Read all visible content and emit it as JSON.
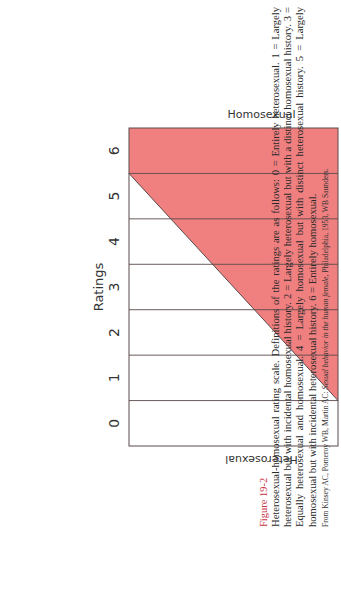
{
  "figure": {
    "label": "Figure 19-2",
    "caption": "Heterosexual-homosexual rating scale. Definitions of the ratings are as follows: 0 = Entirely heterosexual. 1 = Largely heterosexual but with incidental homosexual history. 2 = Largely heterosexual but with a distinct homosexual history. 3 = Equally heterosexual and homosexual. 4 = Largely homosexual but with distinct heterosexual history. 5 = Largely homosexual but with incidental heterosexual history. 6 = Entirely homosexual.",
    "source_prefix": "From Kinsey AC, Pomeroy WB, Martin AC: ",
    "source_title": "Sexual behavior in the human female,",
    "source_suffix": " Philadelphia, 1953, WB Saunders."
  },
  "chart_data": {
    "type": "area",
    "title": "Heterosexual-homosexual rating scale",
    "xlabel": "Ratings",
    "categories": [
      "0",
      "1",
      "2",
      "3",
      "4",
      "5",
      "6"
    ],
    "x": [
      0,
      1,
      2,
      3,
      4,
      5,
      6
    ],
    "series": [
      {
        "name": "Homosexual",
        "color": "#f08080",
        "boundary": [
          [
            0.5,
            0
          ],
          [
            5.5,
            1
          ]
        ],
        "values": [
          0.0,
          0.1,
          0.3,
          0.5,
          0.7,
          0.9,
          1.0
        ]
      },
      {
        "name": "Heterosexual",
        "color": "#ffffff",
        "values": [
          1.0,
          0.9,
          0.7,
          0.5,
          0.3,
          0.1,
          0.0
        ]
      }
    ],
    "top_label": "Homosexual",
    "bottom_label": "Heterosexual",
    "xlim": [
      -0.5,
      6.5
    ],
    "ylim": [
      0,
      1
    ],
    "grid": true,
    "colors": {
      "fill": "#f08080",
      "line": "#5a4a4a",
      "figure_label": "#c8343f"
    }
  }
}
